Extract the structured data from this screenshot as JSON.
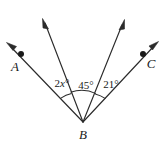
{
  "figure": {
    "type": "geometry-angle-diagram",
    "background_color": "#ffffff",
    "stroke_color": "#2b2b2b",
    "text_color": "#1a1a1a",
    "vertex": {
      "name": "vertex-b",
      "label": "B",
      "x": 83,
      "y": 122,
      "label_x": 83,
      "label_y": 138
    },
    "points": [
      {
        "name": "point-a",
        "label": "A",
        "dot_x": 21,
        "dot_y": 54,
        "label_x": 15,
        "label_y": 70
      },
      {
        "name": "point-c",
        "label": "C",
        "dot_x": 143,
        "dot_y": 54,
        "label_x": 150,
        "label_y": 67
      }
    ],
    "rays": [
      {
        "name": "ray-ba",
        "label": "ray toward A",
        "tip_x": 7,
        "tip_y": 43,
        "has_arrow": true,
        "has_dot": true
      },
      {
        "name": "ray-b-upper-left",
        "label": "unlabeled interior ray left",
        "tip_x": 43,
        "tip_y": 19,
        "has_arrow": true,
        "has_dot": false
      },
      {
        "name": "ray-b-upper-right",
        "label": "unlabeled interior ray right",
        "tip_x": 124,
        "tip_y": 20,
        "has_arrow": true,
        "has_dot": false
      },
      {
        "name": "ray-bc",
        "label": "ray toward C",
        "tip_x": 158,
        "tip_y": 42,
        "has_arrow": true,
        "has_dot": true
      }
    ],
    "angles": [
      {
        "name": "angle-2x",
        "prefix": "2",
        "variable": "x",
        "suffix": "°",
        "full_text": "2x°",
        "label_x": 62,
        "label_y": 87,
        "arc_radius": 27
      },
      {
        "name": "angle-45",
        "prefix": "45",
        "variable": "",
        "suffix": "°",
        "full_text": "45°",
        "label_x": 85,
        "label_y": 89,
        "arc_radius": 30
      },
      {
        "name": "angle-21",
        "prefix": "21",
        "variable": "",
        "suffix": "°",
        "full_text": "21°",
        "label_x": 110,
        "label_y": 88,
        "arc_radius": 27
      }
    ]
  }
}
